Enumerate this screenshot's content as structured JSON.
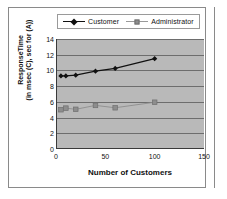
{
  "chart_data": {
    "type": "line",
    "title": "",
    "xlabel": "Number of Customers",
    "ylabel_line1": "ResponseTime",
    "ylabel_line2": "(in msec (C), sec for (A))",
    "xlim": [
      0,
      150
    ],
    "ylim": [
      0,
      14
    ],
    "xticks": [
      0,
      50,
      100,
      150
    ],
    "yticks": [
      0,
      2,
      4,
      6,
      8,
      10,
      12,
      14
    ],
    "grid": true,
    "legend_position": "top",
    "plot_background": "#b9b9b9",
    "series": [
      {
        "name": "Customer",
        "marker": "diamond",
        "color": "#111111",
        "x": [
          5,
          10,
          20,
          40,
          60,
          100
        ],
        "values": [
          9.3,
          9.3,
          9.4,
          9.9,
          10.25,
          11.5
        ]
      },
      {
        "name": "Administrator",
        "marker": "square",
        "color": "#8d8d8d",
        "x": [
          5,
          10,
          20,
          40,
          60,
          100
        ],
        "values": [
          5.0,
          5.2,
          5.05,
          5.55,
          5.25,
          5.95
        ]
      }
    ]
  },
  "legend": {
    "entries": [
      {
        "label": "Customer"
      },
      {
        "label": "Administrator"
      }
    ]
  },
  "axes": {
    "x_title": "Number of Customers",
    "y_title_line1": "ResponseTime",
    "y_title_line2": "(in msec (C), sec for (A))",
    "xticks": [
      "0",
      "50",
      "100",
      "150"
    ],
    "yticks": [
      "0",
      "2",
      "4",
      "6",
      "8",
      "10",
      "12",
      "14"
    ]
  }
}
